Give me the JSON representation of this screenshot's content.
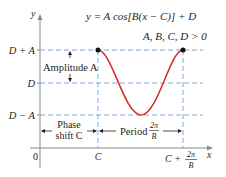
{
  "equation": "y = A cos[B(x − C)] + D",
  "condition": "A, B, C, D > 0",
  "axes": {
    "x_label": "x",
    "y_label": "y",
    "origin_label": "0"
  },
  "y_levels": {
    "max": "D + A",
    "mid": "D",
    "min": "D − A"
  },
  "x_ticks": {
    "start": "C",
    "end_prefix": "C +",
    "end_frac_num": "2π",
    "end_frac_den": "B"
  },
  "annotations": {
    "amplitude": "Amplitude A",
    "phase_line1": "Phase",
    "phase_line2": "shift C",
    "period_word": "Period",
    "period_frac_num": "2π",
    "period_frac_den": "B"
  },
  "colors": {
    "curve": "#d7302a",
    "guide": "#7fa9d6",
    "axis": "#8a8a8a",
    "text": "#231f20"
  }
}
